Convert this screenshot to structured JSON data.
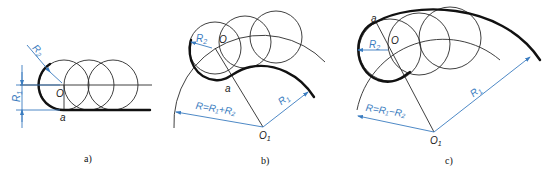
{
  "figure": {
    "panels": [
      {
        "id": "a",
        "caption": "a)",
        "labels": {
          "center": "O",
          "point": "a",
          "r1": "R",
          "r1_sub": "1",
          "r2": "R",
          "r2_sub": "2"
        }
      },
      {
        "id": "b",
        "caption": "b)",
        "labels": {
          "center": "O",
          "point": "a",
          "r1": "R",
          "r1_sub": "1",
          "r2": "R",
          "r2_sub": "2",
          "big_center": "O",
          "big_center_sub": "1",
          "radius_formula": "R=R₁+R₂"
        }
      },
      {
        "id": "c",
        "caption": "c)",
        "labels": {
          "center": "O",
          "point": "a",
          "r1": "R",
          "r1_sub": "1",
          "r2": "R",
          "r2_sub": "2",
          "big_center": "O",
          "big_center_sub": "1",
          "radius_formula": "R=R₁−R₂"
        }
      }
    ],
    "colors": {
      "line": "#111111",
      "dimension": "#3a7cc0",
      "background": "#ffffff"
    }
  }
}
